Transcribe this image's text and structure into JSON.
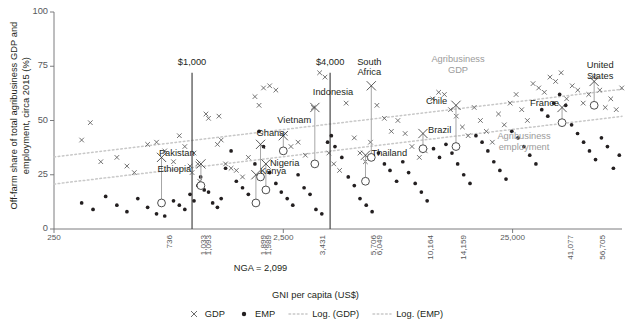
{
  "chart_data": {
    "type": "scatter",
    "title": "",
    "xlabel": "GNI per capita (US$)",
    "ylabel": "Off-farm share of total agribusiness GDP and employment, circa 2015 (%)",
    "ylim": [
      0,
      100
    ],
    "yticks": [
      0,
      25,
      50,
      75,
      100
    ],
    "ytick_labels": [
      "0",
      "25",
      "50",
      "75",
      "100"
    ],
    "xscale": "log",
    "xlim": [
      250,
      75000
    ],
    "xtick_labels": [
      "250",
      "736",
      "1,033",
      "1,093",
      "1,899",
      "1,989",
      "2,500",
      "3,431",
      "5,706",
      "6,049",
      "10,164",
      "14,159",
      "25,000",
      "41,077",
      "56,705"
    ],
    "xtick_values": [
      250,
      736,
      1033,
      1093,
      1899,
      1989,
      2500,
      3431,
      5706,
      6049,
      10164,
      14159,
      25000,
      41077,
      56705
    ],
    "xtick_major": [
      "250",
      "2,500",
      "25,000"
    ],
    "grid": false,
    "legend_position": "bottom",
    "note": "NGA = 2,099",
    "reference_lines": [
      {
        "label": "$1,000",
        "x": 1000
      },
      {
        "label": "$4,000",
        "x": 4000
      }
    ],
    "trend_labels": [
      {
        "text": "Agribusiness GDP",
        "series": "Log. (GDP)"
      },
      {
        "text": "Agribusiness employment",
        "series": "Log. (EMP)"
      }
    ],
    "legend": [
      {
        "label": "GDP",
        "marker": "x",
        "color": "#5b5b5b"
      },
      {
        "label": "EMP",
        "marker": "dot",
        "color": "#231f20"
      },
      {
        "label": "Log. (GDP)",
        "marker": "dotted-line",
        "color": "#c9c9c9"
      },
      {
        "label": "Log. (EMP)",
        "marker": "dotted-line",
        "color": "#c9c9c9"
      }
    ],
    "series": [
      {
        "name": "GDP",
        "marker": "x",
        "points": [
          [
            330,
            41
          ],
          [
            360,
            49
          ],
          [
            400,
            31
          ],
          [
            470,
            33
          ],
          [
            520,
            29
          ],
          [
            560,
            26
          ],
          [
            640,
            39
          ],
          [
            700,
            40
          ],
          [
            760,
            36
          ],
          [
            830,
            31
          ],
          [
            880,
            43
          ],
          [
            930,
            38
          ],
          [
            980,
            29
          ],
          [
            1000,
            26
          ],
          [
            1020,
            35
          ],
          [
            1060,
            30
          ],
          [
            1080,
            22
          ],
          [
            1150,
            53
          ],
          [
            1180,
            51
          ],
          [
            1310,
            52
          ],
          [
            1290,
            39
          ],
          [
            1340,
            41
          ],
          [
            1400,
            30
          ],
          [
            1480,
            28
          ],
          [
            1560,
            27
          ],
          [
            1660,
            24
          ],
          [
            1760,
            33
          ],
          [
            1880,
            61
          ],
          [
            1960,
            57
          ],
          [
            2050,
            65
          ],
          [
            2180,
            66
          ],
          [
            2320,
            64
          ],
          [
            2550,
            44
          ],
          [
            2700,
            38
          ],
          [
            2900,
            40
          ],
          [
            3120,
            34
          ],
          [
            3380,
            56
          ],
          [
            3600,
            72
          ],
          [
            3800,
            70
          ],
          [
            3950,
            35
          ],
          [
            4150,
            30
          ],
          [
            4400,
            27
          ],
          [
            4700,
            58
          ],
          [
            5100,
            42
          ],
          [
            5400,
            35
          ],
          [
            5700,
            31
          ],
          [
            6000,
            40
          ],
          [
            6400,
            57
          ],
          [
            6900,
            51
          ],
          [
            7400,
            45
          ],
          [
            7900,
            50
          ],
          [
            8500,
            44
          ],
          [
            9100,
            38
          ],
          [
            9800,
            33
          ],
          [
            10400,
            36
          ],
          [
            11200,
            60
          ],
          [
            11900,
            63
          ],
          [
            12600,
            62
          ],
          [
            13400,
            55
          ],
          [
            14200,
            52
          ],
          [
            15100,
            47
          ],
          [
            16000,
            43
          ],
          [
            17000,
            56
          ],
          [
            18100,
            50
          ],
          [
            19200,
            45
          ],
          [
            20400,
            40
          ],
          [
            21700,
            53
          ],
          [
            23000,
            48
          ],
          [
            24400,
            58
          ],
          [
            25900,
            62
          ],
          [
            27400,
            55
          ],
          [
            29000,
            50
          ],
          [
            30700,
            67
          ],
          [
            32500,
            65
          ],
          [
            34400,
            63
          ],
          [
            36400,
            70
          ],
          [
            38500,
            68
          ],
          [
            40700,
            72
          ],
          [
            43000,
            60
          ],
          [
            45500,
            66
          ],
          [
            48100,
            64
          ],
          [
            50800,
            58
          ],
          [
            53700,
            62
          ],
          [
            56800,
            70
          ],
          [
            60000,
            64
          ],
          [
            63400,
            56
          ],
          [
            67000,
            60
          ],
          [
            70800,
            55
          ],
          [
            74800,
            65
          ]
        ]
      },
      {
        "name": "EMP",
        "marker": "dot",
        "points": [
          [
            330,
            12
          ],
          [
            370,
            9
          ],
          [
            420,
            15
          ],
          [
            470,
            11
          ],
          [
            520,
            8
          ],
          [
            580,
            14
          ],
          [
            640,
            10
          ],
          [
            700,
            7
          ],
          [
            760,
            6
          ],
          [
            830,
            13
          ],
          [
            880,
            11
          ],
          [
            930,
            9
          ],
          [
            980,
            16
          ],
          [
            1020,
            13
          ],
          [
            1060,
            20
          ],
          [
            1090,
            24
          ],
          [
            1130,
            18
          ],
          [
            1180,
            17
          ],
          [
            1230,
            12
          ],
          [
            1290,
            10
          ],
          [
            1340,
            14
          ],
          [
            1400,
            28
          ],
          [
            1480,
            36
          ],
          [
            1560,
            22
          ],
          [
            1660,
            19
          ],
          [
            1760,
            16
          ],
          [
            1880,
            30
          ],
          [
            1960,
            45
          ],
          [
            2050,
            38
          ],
          [
            2180,
            26
          ],
          [
            2320,
            21
          ],
          [
            2450,
            17
          ],
          [
            2600,
            14
          ],
          [
            2750,
            11
          ],
          [
            2900,
            25
          ],
          [
            3080,
            19
          ],
          [
            3270,
            16
          ],
          [
            3470,
            9
          ],
          [
            3680,
            7
          ],
          [
            3900,
            40
          ],
          [
            4050,
            43
          ],
          [
            4200,
            38
          ],
          [
            4500,
            33
          ],
          [
            4800,
            24
          ],
          [
            5100,
            20
          ],
          [
            5400,
            14
          ],
          [
            5750,
            11
          ],
          [
            6100,
            8
          ],
          [
            6500,
            35
          ],
          [
            6900,
            30
          ],
          [
            7300,
            27
          ],
          [
            7800,
            22
          ],
          [
            8300,
            31
          ],
          [
            8800,
            26
          ],
          [
            9400,
            21
          ],
          [
            10000,
            17
          ],
          [
            10600,
            13
          ],
          [
            11300,
            37
          ],
          [
            12000,
            33
          ],
          [
            12800,
            39
          ],
          [
            13600,
            35
          ],
          [
            14400,
            30
          ],
          [
            15300,
            25
          ],
          [
            16300,
            21
          ],
          [
            17300,
            43
          ],
          [
            18400,
            40
          ],
          [
            19500,
            36
          ],
          [
            20700,
            31
          ],
          [
            22000,
            27
          ],
          [
            23400,
            23
          ],
          [
            24800,
            45
          ],
          [
            26400,
            42
          ],
          [
            28000,
            38
          ],
          [
            29700,
            34
          ],
          [
            31600,
            30
          ],
          [
            33500,
            55
          ],
          [
            35600,
            52
          ],
          [
            37800,
            58
          ],
          [
            40100,
            62
          ],
          [
            42600,
            57
          ],
          [
            45200,
            48
          ],
          [
            48000,
            44
          ],
          [
            51000,
            40
          ],
          [
            54100,
            36
          ],
          [
            57500,
            32
          ],
          [
            61000,
            42
          ],
          [
            64800,
            38
          ],
          [
            68800,
            28
          ],
          [
            73000,
            34
          ]
        ]
      }
    ],
    "labeled_countries": [
      {
        "name": "Ethiopia",
        "gni": 736,
        "gdp": 33,
        "emp": 12,
        "label_dx": -4,
        "label_dy": 14
      },
      {
        "name": "Pakistan",
        "gni": 1093,
        "gdp": 30,
        "emp": 20,
        "label_dx": -42,
        "label_dy": -9
      },
      {
        "name": "Kenya",
        "gni": 1899,
        "gdp": 25,
        "emp": 12,
        "label_dx": 4,
        "label_dy": -2
      },
      {
        "name": "Ghana",
        "gni": 1989,
        "gdp": 39,
        "emp": 24,
        "label_dx": -4,
        "label_dy": -9
      },
      {
        "name": "Nigeria",
        "gni": 2099,
        "gdp": 30,
        "emp": 18,
        "label_dx": 4,
        "label_dy": 1
      },
      {
        "name": "Vietnam",
        "gni": 2500,
        "gdp": 43,
        "emp": 36,
        "label_dx": -6,
        "label_dy": -14
      },
      {
        "name": "Indonesia",
        "gni": 3431,
        "gdp": 56,
        "emp": 30,
        "label_dx": -2,
        "label_dy": -13
      },
      {
        "name": "Thailand",
        "gni": 5706,
        "gdp": 34,
        "emp": 22,
        "label_dx": 6,
        "label_dy": 0
      },
      {
        "name": "South Africa",
        "gni": 6049,
        "gdp": 66,
        "emp": 33,
        "label_dx": -2,
        "label_dy": -22
      },
      {
        "name": "Brazil",
        "gni": 10164,
        "gdp": 44,
        "emp": 37,
        "label_dx": 5,
        "label_dy": -2
      },
      {
        "name": "Chile",
        "gni": 14159,
        "gdp": 57,
        "emp": 38,
        "label_dx": -30,
        "label_dy": -2
      },
      {
        "name": "France",
        "gni": 41077,
        "gdp": 56,
        "emp": 49,
        "label_dx": -32,
        "label_dy": -2
      },
      {
        "name": "United States",
        "gni": 56705,
        "gdp": 68,
        "emp": 57,
        "label_dx": 6,
        "label_dy": -14
      }
    ]
  },
  "colors": {
    "axis": "#6d6e71",
    "tick_text": "#58595b",
    "text": "#231f20",
    "gdp_marker": "#5b5b5b",
    "emp_marker": "#231f20",
    "trend": "#c8c8c8",
    "refline": "#4d4d4d",
    "trend_label": "#9b9b9b",
    "connector": "#a6a6a6"
  }
}
